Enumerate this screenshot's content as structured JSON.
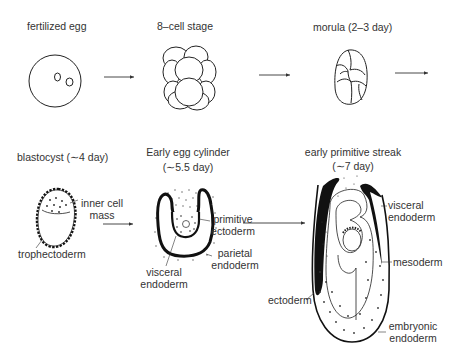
{
  "diagram": {
    "type": "developmental-stages",
    "stages": [
      {
        "id": "fertilized-egg",
        "label": "fertilized egg"
      },
      {
        "id": "8-cell",
        "label": "8–cell stage"
      },
      {
        "id": "morula",
        "label": "morula (2–3 day)"
      },
      {
        "id": "blastocyst",
        "label": "blastocyst (∼4 day)",
        "parts": {
          "icm": "inner cell",
          "icm2": "mass",
          "troph": "trophectoderm"
        }
      },
      {
        "id": "egg-cylinder",
        "label": "Early egg cylinder",
        "sublabel": "(∼5.5 day)",
        "parts": {
          "pe1": "primitive",
          "pe2": "ectoderm",
          "par1": "parietal",
          "par2": "endoderm",
          "vis1": "visceral",
          "vis2": "endoderm"
        }
      },
      {
        "id": "primitive-streak",
        "label": "early primitive streak",
        "sublabel": "(∼7 day)",
        "parts": {
          "ve1": "visceral",
          "ve2": "endoderm",
          "meso": "mesoderm",
          "ecto": "ectoderm",
          "emb1": "embryonic",
          "emb2": "endoderm"
        }
      }
    ],
    "arrows": 4,
    "colors": {
      "ink": "#1a1a1a",
      "text": "#333333",
      "background": "#ffffff"
    }
  }
}
